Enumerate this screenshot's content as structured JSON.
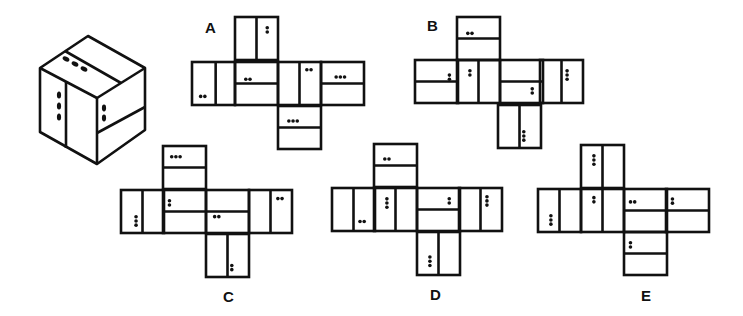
{
  "puzzle": {
    "description": "Which net folds into the cube shown?",
    "cube": {
      "name": "reference-cube",
      "faces": {
        "top": {
          "divider": "diagonal-split",
          "dots": 3
        },
        "left": {
          "divider": "vertical-split",
          "dots": 3
        },
        "right": {
          "divider": "horizontal-split",
          "dots": 2
        }
      }
    },
    "options": [
      {
        "label": "A",
        "x": 205,
        "y": 30
      },
      {
        "label": "B",
        "x": 427,
        "y": 28
      },
      {
        "label": "C",
        "x": 223,
        "y": 289
      },
      {
        "label": "D",
        "x": 430,
        "y": 287
      },
      {
        "label": "E",
        "x": 641,
        "y": 288
      }
    ]
  },
  "nets": {
    "A": {
      "cell": 43,
      "faces": [
        {
          "x": 235,
          "y": 17,
          "split": "v",
          "pos": 0.5,
          "dots": [
            {
              "n": 2,
              "o": "v",
              "fx": 0.75,
              "fy": 0.3
            }
          ]
        },
        {
          "x": 192,
          "y": 62,
          "split": "v",
          "pos": 0.55,
          "dots": [
            {
              "n": 2,
              "o": "h",
              "fx": 0.25,
              "fy": 0.8
            }
          ]
        },
        {
          "x": 235,
          "y": 62,
          "split": "h",
          "pos": 0.5,
          "dots": [
            {
              "n": 2,
              "o": "h",
              "fx": 0.3,
              "fy": 0.4
            }
          ]
        },
        {
          "x": 278,
          "y": 62,
          "split": "v",
          "pos": 0.5,
          "dots": [
            {
              "n": 2,
              "o": "h",
              "fx": 0.72,
              "fy": 0.18
            }
          ]
        },
        {
          "x": 321,
          "y": 62,
          "split": "h",
          "pos": 0.5,
          "dots": [
            {
              "n": 3,
              "o": "h",
              "fx": 0.45,
              "fy": 0.35
            }
          ]
        },
        {
          "x": 278,
          "y": 106,
          "split": "h",
          "pos": 0.5,
          "dots": [
            {
              "n": 3,
              "o": "h",
              "fx": 0.35,
              "fy": 0.35
            }
          ]
        }
      ]
    },
    "B": {
      "cell": 43,
      "faces": [
        {
          "x": 457,
          "y": 17,
          "split": "h",
          "pos": 0.5,
          "dots": [
            {
              "n": 2,
              "o": "h",
              "fx": 0.3,
              "fy": 0.38
            }
          ]
        },
        {
          "x": 415,
          "y": 60,
          "split": "h",
          "pos": 0.5,
          "dots": [
            {
              "n": 2,
              "o": "v",
              "fx": 0.8,
              "fy": 0.4
            }
          ]
        },
        {
          "x": 457,
          "y": 60,
          "split": "v",
          "pos": 0.5,
          "dots": [
            {
              "n": 2,
              "o": "v",
              "fx": 0.3,
              "fy": 0.3
            }
          ]
        },
        {
          "x": 500,
          "y": 60,
          "split": "h",
          "pos": 0.5,
          "dots": [
            {
              "n": 2,
              "o": "v",
              "fx": 0.75,
              "fy": 0.72
            }
          ]
        },
        {
          "x": 540,
          "y": 60,
          "split": "v",
          "pos": 0.5,
          "dots": [
            {
              "n": 3,
              "o": "v",
              "fx": 0.63,
              "fy": 0.35
            }
          ]
        },
        {
          "x": 498,
          "y": 105,
          "split": "v",
          "pos": 0.5,
          "dots": [
            {
              "n": 3,
              "o": "v",
              "fx": 0.6,
              "fy": 0.72
            }
          ]
        }
      ]
    },
    "C": {
      "cell": 43,
      "faces": [
        {
          "x": 163,
          "y": 146,
          "split": "h",
          "pos": 0.5,
          "dots": [
            {
              "n": 3,
              "o": "h",
              "fx": 0.3,
              "fy": 0.25
            }
          ]
        },
        {
          "x": 121,
          "y": 190,
          "split": "v",
          "pos": 0.5,
          "dots": [
            {
              "n": 3,
              "o": "v",
              "fx": 0.35,
              "fy": 0.72
            }
          ]
        },
        {
          "x": 163,
          "y": 190,
          "split": "h",
          "pos": 0.5,
          "dots": [
            {
              "n": 2,
              "o": "v",
              "fx": 0.15,
              "fy": 0.3
            }
          ]
        },
        {
          "x": 206,
          "y": 190,
          "split": "h",
          "pos": 0.5,
          "dots": [
            {
              "n": 2,
              "o": "h",
              "fx": 0.25,
              "fy": 0.62
            }
          ]
        },
        {
          "x": 249,
          "y": 190,
          "split": "v",
          "pos": 0.5,
          "dots": [
            {
              "n": 2,
              "o": "h",
              "fx": 0.72,
              "fy": 0.2
            }
          ]
        },
        {
          "x": 206,
          "y": 234,
          "split": "v",
          "pos": 0.5,
          "dots": [
            {
              "n": 2,
              "o": "v",
              "fx": 0.6,
              "fy": 0.78
            }
          ]
        }
      ]
    },
    "D": {
      "cell": 43,
      "faces": [
        {
          "x": 374,
          "y": 144,
          "split": "h",
          "pos": 0.5,
          "dots": [
            {
              "n": 2,
              "o": "h",
              "fx": 0.3,
              "fy": 0.35
            }
          ]
        },
        {
          "x": 332,
          "y": 188,
          "split": "v",
          "pos": 0.5,
          "dots": [
            {
              "n": 2,
              "o": "h",
              "fx": 0.7,
              "fy": 0.78
            }
          ]
        },
        {
          "x": 374,
          "y": 188,
          "split": "v",
          "pos": 0.5,
          "dots": [
            {
              "n": 3,
              "o": "v",
              "fx": 0.3,
              "fy": 0.35
            }
          ]
        },
        {
          "x": 417,
          "y": 188,
          "split": "h",
          "pos": 0.5,
          "dots": [
            {
              "n": 2,
              "o": "v",
              "fx": 0.75,
              "fy": 0.3
            }
          ]
        },
        {
          "x": 459,
          "y": 188,
          "split": "v",
          "pos": 0.5,
          "dots": [
            {
              "n": 3,
              "o": "v",
              "fx": 0.65,
              "fy": 0.3
            }
          ]
        },
        {
          "x": 417,
          "y": 232,
          "split": "v",
          "pos": 0.5,
          "dots": [
            {
              "n": 3,
              "o": "v",
              "fx": 0.3,
              "fy": 0.68
            }
          ]
        }
      ]
    },
    "E": {
      "cell": 43,
      "faces": [
        {
          "x": 581,
          "y": 145,
          "split": "v",
          "pos": 0.5,
          "dots": [
            {
              "n": 3,
              "o": "v",
              "fx": 0.3,
              "fy": 0.35
            }
          ]
        },
        {
          "x": 538,
          "y": 189,
          "split": "v",
          "pos": 0.5,
          "dots": [
            {
              "n": 3,
              "o": "v",
              "fx": 0.3,
              "fy": 0.72
            }
          ]
        },
        {
          "x": 581,
          "y": 189,
          "split": "v",
          "pos": 0.5,
          "dots": [
            {
              "n": 2,
              "o": "v",
              "fx": 0.3,
              "fy": 0.25
            }
          ]
        },
        {
          "x": 624,
          "y": 189,
          "split": "h",
          "pos": 0.5,
          "dots": [
            {
              "n": 2,
              "o": "h",
              "fx": 0.2,
              "fy": 0.3
            }
          ]
        },
        {
          "x": 666,
          "y": 189,
          "split": "h",
          "pos": 0.5,
          "dots": [
            {
              "n": 2,
              "o": "v",
              "fx": 0.15,
              "fy": 0.28
            }
          ]
        },
        {
          "x": 624,
          "y": 232,
          "split": "h",
          "pos": 0.5,
          "dots": [
            {
              "n": 2,
              "o": "v",
              "fx": 0.15,
              "fy": 0.3
            }
          ]
        }
      ]
    }
  },
  "colors": {
    "stroke": "#111111",
    "background": "#ffffff"
  }
}
